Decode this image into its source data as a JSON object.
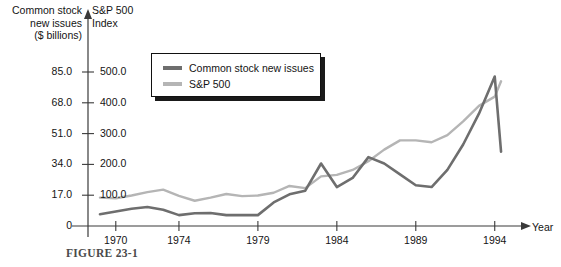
{
  "caption": "FIGURE 23-1",
  "legend": {
    "items": [
      {
        "label": "Common stock new issues",
        "color": "#6e6e6e",
        "icon": "line-swatch-icon"
      },
      {
        "label": "S&P 500",
        "color": "#b5b5b5",
        "icon": "line-swatch-icon"
      }
    ]
  },
  "axes": {
    "left_title": "Common stock\nnew issues\n($ billions)",
    "right_title": "S&P 500\nIndex",
    "x_title": "Year",
    "left_ticks": [
      "85.0",
      "68.0",
      "51.0",
      "34.0",
      "17.0",
      "0"
    ],
    "right_ticks": [
      "500.0",
      "400.0",
      "300.0",
      "200.0",
      "100.0"
    ],
    "x_ticks": [
      "1970",
      "1974",
      "1979",
      "1984",
      "1989",
      "1994"
    ]
  },
  "chart_data": {
    "type": "line",
    "xlabel": "Year",
    "ylabel": "Common stock new issues ($ billions)",
    "ylabel_right": "S&P 500 Index",
    "grid": false,
    "legend_position": "top-center",
    "xlim": [
      1969,
      1995
    ],
    "ylim_left": [
      0,
      85
    ],
    "ylim_right": [
      0,
      500
    ],
    "x": [
      1969,
      1970,
      1971,
      1972,
      1973,
      1974,
      1975,
      1976,
      1977,
      1978,
      1979,
      1980,
      1981,
      1982,
      1983,
      1984,
      1985,
      1986,
      1987,
      1988,
      1989,
      1990,
      1991,
      1992,
      1993,
      1994,
      1994.4
    ],
    "series": [
      {
        "name": "Common stock new issues",
        "color": "#6e6e6e",
        "axis": "left",
        "units": "$ billions",
        "values": [
          6.5,
          8.0,
          9.5,
          10.5,
          9.0,
          6.0,
          7.0,
          7.2,
          6.0,
          6.0,
          6.0,
          13.0,
          17.5,
          19.5,
          34.5,
          21.5,
          26.5,
          38.0,
          34.5,
          28.5,
          22.5,
          21.5,
          31.0,
          45.0,
          62.0,
          82.5,
          41.0
        ]
      },
      {
        "name": "S&P 500",
        "color": "#b5b5b5",
        "axis": "right",
        "units": "index",
        "values": [
          92.0,
          90.0,
          99.0,
          110.0,
          118.0,
          98.0,
          82.0,
          92.0,
          104.0,
          97.0,
          99.0,
          108.0,
          130.0,
          123.0,
          161.0,
          166.0,
          182.0,
          210.0,
          248.0,
          278.0,
          278.0,
          272.0,
          295.0,
          340.0,
          390.0,
          420.0,
          470.0
        ]
      }
    ]
  },
  "plot_geometry": {
    "x_axis_y": 226,
    "y_axis_x": 88,
    "x_start": 100,
    "x_end": 520,
    "year_min": 1969,
    "year_max": 1995.6,
    "y_top_value_left": 85.0,
    "y_top_px": 72,
    "y_zero_px": 226
  }
}
